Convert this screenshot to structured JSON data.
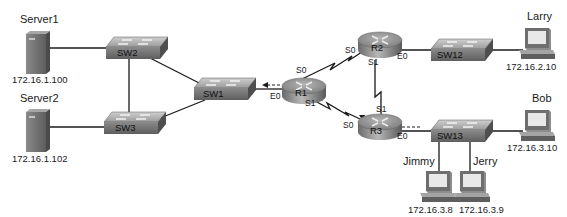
{
  "diagram": {
    "type": "network-topology",
    "hosts": {
      "server1": {
        "name": "Server1",
        "ip": "172.16.1.100",
        "icon": "server-icon"
      },
      "server2": {
        "name": "Server2",
        "ip": "172.16.1.102",
        "icon": "server-icon"
      },
      "larry": {
        "name": "Larry",
        "ip": "172.16.2.10",
        "icon": "pc-icon"
      },
      "bob": {
        "name": "Bob",
        "ip": "172.16.3.10",
        "icon": "pc-icon"
      },
      "jimmy": {
        "name": "Jimmy",
        "ip": "172.16.3.8",
        "icon": "pc-icon"
      },
      "jerry": {
        "name": "Jerry",
        "ip": "172.16.3.9",
        "icon": "pc-icon"
      }
    },
    "switches": {
      "sw1": {
        "name": "SW1"
      },
      "sw2": {
        "name": "SW2"
      },
      "sw3": {
        "name": "SW3"
      },
      "sw12": {
        "name": "SW12"
      },
      "sw13": {
        "name": "SW13"
      }
    },
    "routers": {
      "r1": {
        "name": "R1",
        "interfaces": {
          "s0": "S0",
          "s1": "S1",
          "e0": "E0"
        }
      },
      "r2": {
        "name": "R2",
        "interfaces": {
          "s0": "S0",
          "s1": "S1",
          "e0": "E0"
        }
      },
      "r3": {
        "name": "R3",
        "interfaces": {
          "s0": "S0",
          "s1": "S1",
          "e0": "E0"
        }
      }
    },
    "links": [
      {
        "from": "Server1",
        "to": "SW2",
        "type": "ethernet"
      },
      {
        "from": "Server2",
        "to": "SW3",
        "type": "ethernet"
      },
      {
        "from": "SW2",
        "to": "SW3",
        "type": "ethernet"
      },
      {
        "from": "SW2",
        "to": "SW1",
        "type": "ethernet"
      },
      {
        "from": "SW3",
        "to": "SW1",
        "type": "ethernet"
      },
      {
        "from": "SW1",
        "to": "R1 E0",
        "type": "ethernet"
      },
      {
        "from": "R1 S0",
        "to": "R2 S0",
        "type": "serial"
      },
      {
        "from": "R1 S1",
        "to": "R3 S0",
        "type": "serial"
      },
      {
        "from": "R2 S1",
        "to": "R3 S1",
        "type": "serial"
      },
      {
        "from": "R2 E0",
        "to": "SW12",
        "type": "ethernet"
      },
      {
        "from": "SW12",
        "to": "Larry",
        "type": "ethernet"
      },
      {
        "from": "R3 E0",
        "to": "SW13",
        "type": "ethernet"
      },
      {
        "from": "SW13",
        "to": "Bob",
        "type": "ethernet"
      },
      {
        "from": "SW13",
        "to": "Jimmy",
        "type": "ethernet"
      },
      {
        "from": "SW13",
        "to": "Jerry",
        "type": "ethernet"
      }
    ],
    "packet_flow": [
      {
        "description": "dashed arrow from R3 E0 side toward R3",
        "style": "dashed-arrow"
      },
      {
        "description": "dashed arrow from R3 S0 toward R1 S1",
        "style": "dashed-arrow"
      },
      {
        "description": "dashed arrow from R1 E0 toward SW1",
        "style": "dashed-arrow"
      }
    ],
    "colors": {
      "line": "#1a1a1a",
      "device_dark": "#6b6b6b",
      "device_light": "#bdbdbd",
      "background": "#ffffff"
    }
  }
}
